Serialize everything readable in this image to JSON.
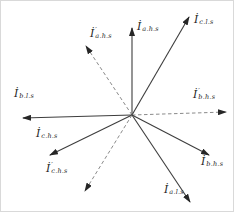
{
  "diagram": {
    "width": 234,
    "height": 212,
    "background": "#ffffff",
    "border_color": "#d9d9d9",
    "center": {
      "x": 131,
      "y": 114
    },
    "colors": {
      "solid_line": "#3d3d3d",
      "dashed_line": "#7d7d7d",
      "arrowhead": "#262626",
      "label": "#1f1f1f"
    },
    "vectors": [
      {
        "id": "i-a-hs",
        "symbol": "İ",
        "prime": "",
        "subscript": "a.h.s",
        "style": "solid",
        "tip": {
          "x": 131,
          "y": 27
        },
        "label_pos": {
          "x": 136,
          "y": 20
        }
      },
      {
        "id": "i-c-ls",
        "symbol": "İ",
        "prime": "",
        "subscript": "c.l.s",
        "style": "solid",
        "tip": {
          "x": 188,
          "y": 16
        },
        "label_pos": {
          "x": 193,
          "y": 13
        }
      },
      {
        "id": "i-prime-a-hs",
        "symbol": "İ",
        "prime": "′",
        "subscript": "a.h.s",
        "style": "dashed",
        "tip": {
          "x": 85,
          "y": 45
        },
        "label_pos": {
          "x": 89,
          "y": 27
        }
      },
      {
        "id": "i-b-ls",
        "symbol": "İ",
        "prime": "",
        "subscript": "b.l.s",
        "style": "solid",
        "tip": {
          "x": 22,
          "y": 117
        },
        "label_pos": {
          "x": 13,
          "y": 87
        }
      },
      {
        "id": "i-prime-b-hs",
        "symbol": "İ",
        "prime": "′",
        "subscript": "b.h.s",
        "style": "dashed",
        "tip": {
          "x": 225,
          "y": 111
        },
        "label_pos": {
          "x": 192,
          "y": 88
        }
      },
      {
        "id": "i-c-hs",
        "symbol": "İ",
        "prime": "",
        "subscript": "c.h.s",
        "style": "solid",
        "tip": {
          "x": 49,
          "y": 154
        },
        "label_pos": {
          "x": 35,
          "y": 127
        }
      },
      {
        "id": "i-prime-c-hs",
        "symbol": "İ",
        "prime": "′",
        "subscript": "c.h.s",
        "style": "dashed",
        "tip": {
          "x": 84,
          "y": 190
        },
        "label_pos": {
          "x": 45,
          "y": 162
        }
      },
      {
        "id": "i-b-hs",
        "symbol": "İ",
        "prime": "",
        "subscript": "b.h.s",
        "style": "solid",
        "tip": {
          "x": 208,
          "y": 154
        },
        "label_pos": {
          "x": 200,
          "y": 155
        }
      },
      {
        "id": "i-a-ls",
        "symbol": "İ",
        "prime": "",
        "subscript": "a.l.s",
        "style": "solid",
        "tip": {
          "x": 189,
          "y": 201
        },
        "label_pos": {
          "x": 163,
          "y": 183
        }
      }
    ]
  }
}
